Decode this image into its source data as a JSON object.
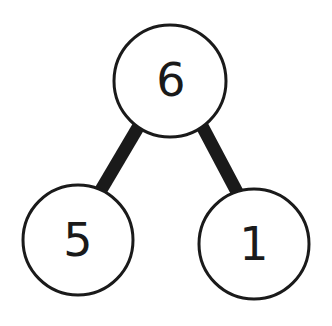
{
  "diagram": {
    "type": "number-bond",
    "whole": {
      "label": "6"
    },
    "parts": [
      {
        "label": "5"
      },
      {
        "label": "1"
      }
    ],
    "colors": {
      "stroke": "#1a1a1a",
      "fill": "#ffffff"
    }
  }
}
